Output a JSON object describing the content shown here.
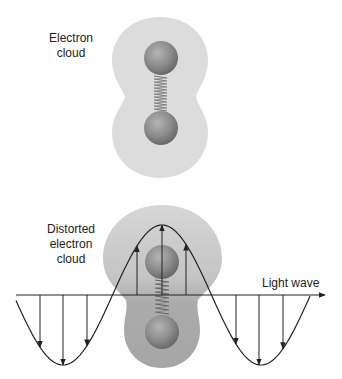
{
  "diagram": {
    "type": "polarizability illustration",
    "top_panel": {
      "label_lines": [
        "Electron",
        "cloud"
      ],
      "cloud_color": "#dcdcdc",
      "atom_color": "#8a8a8a",
      "spring_color": "#6f6f6f"
    },
    "bottom_panel": {
      "label_lines": [
        "Distorted",
        "electron",
        "cloud"
      ],
      "wave_label": "Light wave",
      "cloud_top_color": "#d4d4d4",
      "cloud_bottom_color": "#a9a9a9",
      "wave_color": "#222222",
      "wave": {
        "axis_y": 295,
        "x_start": 16,
        "x_end": 325,
        "amplitude": 70,
        "half_period": 99,
        "peak_x": 162
      },
      "field_arrows": [
        {
          "x": 40,
          "direction": "down"
        },
        {
          "x": 63,
          "direction": "down"
        },
        {
          "x": 87,
          "direction": "down"
        },
        {
          "x": 137,
          "direction": "up"
        },
        {
          "x": 162,
          "direction": "up"
        },
        {
          "x": 186,
          "direction": "up"
        },
        {
          "x": 236,
          "direction": "down"
        },
        {
          "x": 259,
          "direction": "down"
        },
        {
          "x": 283,
          "direction": "down"
        }
      ]
    }
  }
}
